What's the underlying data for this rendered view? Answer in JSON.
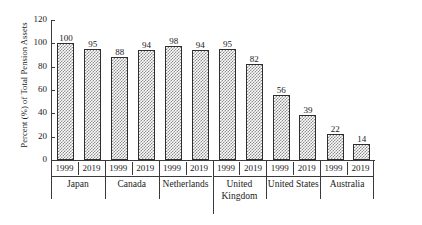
{
  "chart_data": {
    "type": "bar",
    "title": "",
    "xlabel": "",
    "ylabel": "Percent (%) of Total Pension Assets",
    "ylim": [
      0,
      120
    ],
    "yticks": [
      0,
      20,
      40,
      60,
      80,
      100,
      120
    ],
    "grid": false,
    "legend": null,
    "categories": [
      "Japan 1999",
      "Japan 2019",
      "Canada 1999",
      "Canada 2019",
      "Netherlands 1999",
      "Netherlands 2019",
      "United Kingdom 1999",
      "United Kingdom 2019",
      "United States 1999",
      "United States 2019",
      "Australia 1999",
      "Australia 2019"
    ],
    "values": [
      100,
      95,
      88,
      94,
      98,
      94,
      95,
      82,
      56,
      39,
      22,
      14
    ],
    "groups": [
      {
        "country": "Japan",
        "country_lines": [
          "Japan"
        ],
        "bars": [
          {
            "year": "1999",
            "value": 100,
            "label": "100"
          },
          {
            "year": "2019",
            "value": 95,
            "label": "95"
          }
        ]
      },
      {
        "country": "Canada",
        "country_lines": [
          "Canada"
        ],
        "bars": [
          {
            "year": "1999",
            "value": 88,
            "label": "88"
          },
          {
            "year": "2019",
            "value": 94,
            "label": "94"
          }
        ]
      },
      {
        "country": "Netherlands",
        "country_lines": [
          "Netherlands"
        ],
        "bars": [
          {
            "year": "1999",
            "value": 98,
            "label": "98"
          },
          {
            "year": "2019",
            "value": 94,
            "label": "94"
          }
        ]
      },
      {
        "country": "United Kingdom",
        "country_lines": [
          "United",
          "Kingdom"
        ],
        "bars": [
          {
            "year": "1999",
            "value": 95,
            "label": "95"
          },
          {
            "year": "2019",
            "value": 82,
            "label": "82"
          }
        ]
      },
      {
        "country": "United States",
        "country_lines": [
          "United States"
        ],
        "bars": [
          {
            "year": "1999",
            "value": 56,
            "label": "56"
          },
          {
            "year": "2019",
            "value": 39,
            "label": "39"
          }
        ]
      },
      {
        "country": "Australia",
        "country_lines": [
          "Australia"
        ],
        "bars": [
          {
            "year": "1999",
            "value": 22,
            "label": "22"
          },
          {
            "year": "2019",
            "value": 14,
            "label": "14"
          }
        ]
      }
    ],
    "colors": {
      "bar_fill_hatch": "#8c8c8c",
      "bar_background": "#ffffff",
      "bar_outline": "#2e2e2e",
      "axis": "#3a3a3a",
      "text": "#1a1a1a",
      "page_background": "#ffffff"
    }
  }
}
